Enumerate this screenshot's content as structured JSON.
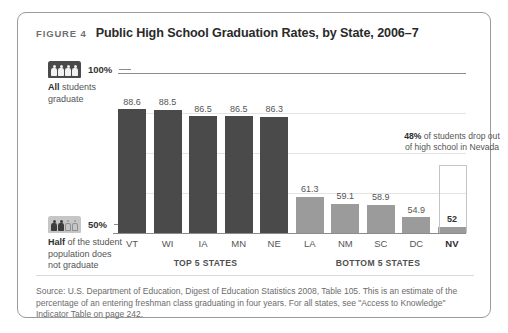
{
  "figure": {
    "number_label": "FIGURE 4",
    "title": "Public High School Graduation Rates, by State, 2006–7"
  },
  "legend": {
    "top": {
      "icon": "four-people-filled-icon",
      "percent": "100%",
      "caption_bold": "All",
      "caption_rest": " students graduate"
    },
    "bottom": {
      "icon": "two-filled-two-outline-people-icon",
      "percent": "50%",
      "caption_bold": "Half",
      "caption_rest": " of the student population does not graduate"
    }
  },
  "annotation": {
    "bold": "48%",
    "rest": " of students drop out of high school in Nevada"
  },
  "groups": {
    "top_label": "TOP 5 STATES",
    "bottom_label": "BOTTOM 5 STATES"
  },
  "source": "Source: U.S. Department of Education, Digest of Education Statistics 2008, Table 105. This is an estimate of the percentage of an entering freshman class graduating in four years. For all states, see \"Access to Knowledge\" Indicator Table on page 242.",
  "chart_data": {
    "type": "bar",
    "title": "Public High School Graduation Rates, by State, 2006–7",
    "xlabel": "",
    "ylabel": "",
    "ylim": [
      50,
      100
    ],
    "grid": true,
    "legend_position": "left",
    "categories": [
      "VT",
      "WI",
      "IA",
      "MN",
      "NE",
      "LA",
      "NM",
      "SC",
      "DC",
      "NV"
    ],
    "values": [
      88.6,
      88.5,
      86.5,
      86.5,
      86.3,
      61.3,
      59.1,
      58.9,
      54.9,
      52
    ],
    "value_labels": [
      "88.6",
      "88.5",
      "86.5",
      "86.5",
      "86.3",
      "61.3",
      "59.1",
      "58.9",
      "54.9",
      "52"
    ],
    "groups": [
      "TOP 5 STATES",
      "TOP 5 STATES",
      "TOP 5 STATES",
      "TOP 5 STATES",
      "TOP 5 STATES",
      "BOTTOM 5 STATES",
      "BOTTOM 5 STATES",
      "BOTTOM 5 STATES",
      "BOTTOM 5 STATES",
      "BOTTOM 5 STATES"
    ],
    "bar_colors": [
      "#4a4a4a",
      "#4a4a4a",
      "#4a4a4a",
      "#4a4a4a",
      "#4a4a4a",
      "#9b9b9b",
      "#9b9b9b",
      "#9b9b9b",
      "#9b9b9b",
      "#9b9b9b"
    ],
    "highlighted": [
      "NV"
    ],
    "axis_labels": [
      "100%",
      "50%"
    ]
  },
  "colors": {
    "bar_dark": "#4a4a4a",
    "bar_light": "#9b9b9b",
    "border": "#9a9a9a",
    "text_muted": "#6c6c6c"
  }
}
